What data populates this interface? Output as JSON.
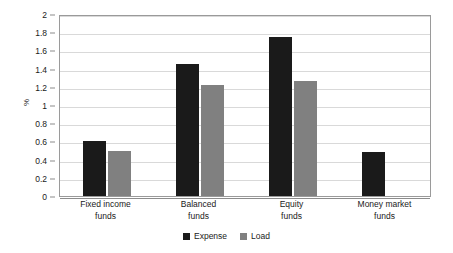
{
  "chart_data": {
    "type": "bar",
    "title": "",
    "xlabel": "",
    "ylabel": "%",
    "ylim": [
      0,
      2
    ],
    "ytick_step": 0.2,
    "yticks": [
      "0",
      "0.2",
      "0.4",
      "0.6",
      "0.8",
      "1",
      "1.2",
      "1.4",
      "1.6",
      "1.8",
      "2"
    ],
    "grid": true,
    "legend_position": "bottom-center",
    "categories": [
      "Fixed income\nfunds",
      "Balanced\nfunds",
      "Equity\nfunds",
      "Money market\nfunds"
    ],
    "series": [
      {
        "name": "Expense",
        "color": "#1a1a1a",
        "values": [
          0.6,
          1.45,
          1.75,
          0.48
        ]
      },
      {
        "name": "Load",
        "color": "#808080",
        "values": [
          0.49,
          1.22,
          1.26,
          null
        ]
      }
    ]
  },
  "legend": {
    "items": [
      {
        "label": "Expense"
      },
      {
        "label": "Load"
      }
    ]
  }
}
